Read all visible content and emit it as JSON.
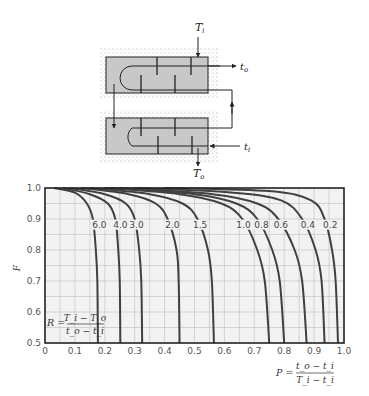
{
  "diagram": {
    "labels": {
      "shell_in": "T",
      "shell_in_sub": "i",
      "shell_out": "T",
      "shell_out_sub": "o",
      "tube_in": "t",
      "tube_in_sub": "i",
      "tube_out": "t",
      "tube_out_sub": "o"
    },
    "colors": {
      "shell_fill": "#c8c8c8",
      "insulation_dots": "#9a9a9a",
      "line": "#222222"
    }
  },
  "chart_data": {
    "type": "line",
    "title": "",
    "xlabel": "P = (t_o - t_i) / (T_i - t_i)",
    "xlabel_parts": {
      "lhs": "P =",
      "num": "t_o − t_i",
      "den": "T_i − t_i"
    },
    "ylabel": "F",
    "xlim": [
      0,
      1.0
    ],
    "ylim": [
      0.5,
      1.0
    ],
    "xticks": [
      "0",
      "0.1",
      "0.2",
      "0.3",
      "0.4",
      "0.5",
      "0.6",
      "0.7",
      "0.8",
      "0.9",
      "1.0"
    ],
    "yticks": [
      "0.5",
      "0.6",
      "0.7",
      "0.8",
      "0.9",
      "1.0"
    ],
    "grid": true,
    "grid_step": 0.05,
    "parameter_label": "R = (T_i - T_o) / (t_o - t_i)",
    "parameter_parts": {
      "lhs": "R =",
      "num": "T_i − T_o",
      "den": "t_o − t_i"
    },
    "shell_passes": 2,
    "series": [
      {
        "name": "6.0",
        "R": 6.0,
        "points": [
          [
            0.03,
            1.0
          ],
          [
            0.1,
            0.985
          ],
          [
            0.14,
            0.95
          ],
          [
            0.16,
            0.9
          ],
          [
            0.17,
            0.8
          ],
          [
            0.175,
            0.7
          ],
          [
            0.177,
            0.5
          ]
        ]
      },
      {
        "name": "4.0",
        "R": 4.0,
        "points": [
          [
            0.06,
            1.0
          ],
          [
            0.15,
            0.98
          ],
          [
            0.21,
            0.95
          ],
          [
            0.235,
            0.9
          ],
          [
            0.245,
            0.8
          ],
          [
            0.25,
            0.7
          ],
          [
            0.252,
            0.5
          ]
        ]
      },
      {
        "name": "3.0",
        "R": 3.0,
        "points": [
          [
            0.08,
            1.0
          ],
          [
            0.2,
            0.98
          ],
          [
            0.27,
            0.95
          ],
          [
            0.3,
            0.9
          ],
          [
            0.315,
            0.8
          ],
          [
            0.322,
            0.7
          ],
          [
            0.325,
            0.5
          ]
        ]
      },
      {
        "name": "2.0",
        "R": 2.0,
        "points": [
          [
            0.12,
            1.0
          ],
          [
            0.28,
            0.98
          ],
          [
            0.37,
            0.95
          ],
          [
            0.41,
            0.9
          ],
          [
            0.44,
            0.8
          ],
          [
            0.447,
            0.7
          ],
          [
            0.45,
            0.5
          ]
        ]
      },
      {
        "name": "1.5",
        "R": 1.5,
        "points": [
          [
            0.15,
            1.0
          ],
          [
            0.35,
            0.98
          ],
          [
            0.46,
            0.95
          ],
          [
            0.51,
            0.9
          ],
          [
            0.545,
            0.8
          ],
          [
            0.558,
            0.7
          ],
          [
            0.565,
            0.5
          ]
        ]
      },
      {
        "name": "1.0",
        "R": 1.0,
        "points": [
          [
            0.2,
            1.0
          ],
          [
            0.45,
            0.98
          ],
          [
            0.59,
            0.95
          ],
          [
            0.66,
            0.9
          ],
          [
            0.71,
            0.8
          ],
          [
            0.735,
            0.7
          ],
          [
            0.75,
            0.5
          ]
        ]
      },
      {
        "name": "0.8",
        "R": 0.8,
        "points": [
          [
            0.22,
            1.0
          ],
          [
            0.5,
            0.98
          ],
          [
            0.64,
            0.95
          ],
          [
            0.71,
            0.9
          ],
          [
            0.76,
            0.8
          ],
          [
            0.785,
            0.7
          ],
          [
            0.8,
            0.5
          ]
        ]
      },
      {
        "name": "0.6",
        "R": 0.6,
        "points": [
          [
            0.25,
            1.0
          ],
          [
            0.56,
            0.98
          ],
          [
            0.71,
            0.95
          ],
          [
            0.78,
            0.9
          ],
          [
            0.835,
            0.8
          ],
          [
            0.86,
            0.7
          ],
          [
            0.875,
            0.5
          ]
        ]
      },
      {
        "name": "0.4",
        "R": 0.4,
        "points": [
          [
            0.3,
            1.0
          ],
          [
            0.63,
            0.985
          ],
          [
            0.79,
            0.96
          ],
          [
            0.86,
            0.9
          ],
          [
            0.905,
            0.8
          ],
          [
            0.925,
            0.7
          ],
          [
            0.935,
            0.5
          ]
        ]
      },
      {
        "name": "0.2",
        "R": 0.2,
        "points": [
          [
            0.4,
            1.0
          ],
          [
            0.75,
            0.99
          ],
          [
            0.89,
            0.96
          ],
          [
            0.935,
            0.9
          ],
          [
            0.96,
            0.8
          ],
          [
            0.972,
            0.7
          ],
          [
            0.98,
            0.5
          ]
        ]
      }
    ],
    "curve_labels": [
      {
        "text": "6.0",
        "x": 0.158,
        "y": 0.872
      },
      {
        "text": "4.0",
        "x": 0.228,
        "y": 0.872
      },
      {
        "text": "3.0",
        "x": 0.282,
        "y": 0.872
      },
      {
        "text": "2.0",
        "x": 0.402,
        "y": 0.872
      },
      {
        "text": "1.5",
        "x": 0.495,
        "y": 0.872
      },
      {
        "text": "1.0",
        "x": 0.64,
        "y": 0.872
      },
      {
        "text": "0.8",
        "x": 0.7,
        "y": 0.872
      },
      {
        "text": "0.6",
        "x": 0.765,
        "y": 0.872
      },
      {
        "text": "0.4",
        "x": 0.855,
        "y": 0.872
      },
      {
        "text": "0.2",
        "x": 0.93,
        "y": 0.872
      }
    ],
    "colors": {
      "plot_bg": "#f2f2f2",
      "grid": "#bdbdbd",
      "curve": "#404040",
      "axis": "#222222",
      "tick_text": "#555555"
    }
  }
}
